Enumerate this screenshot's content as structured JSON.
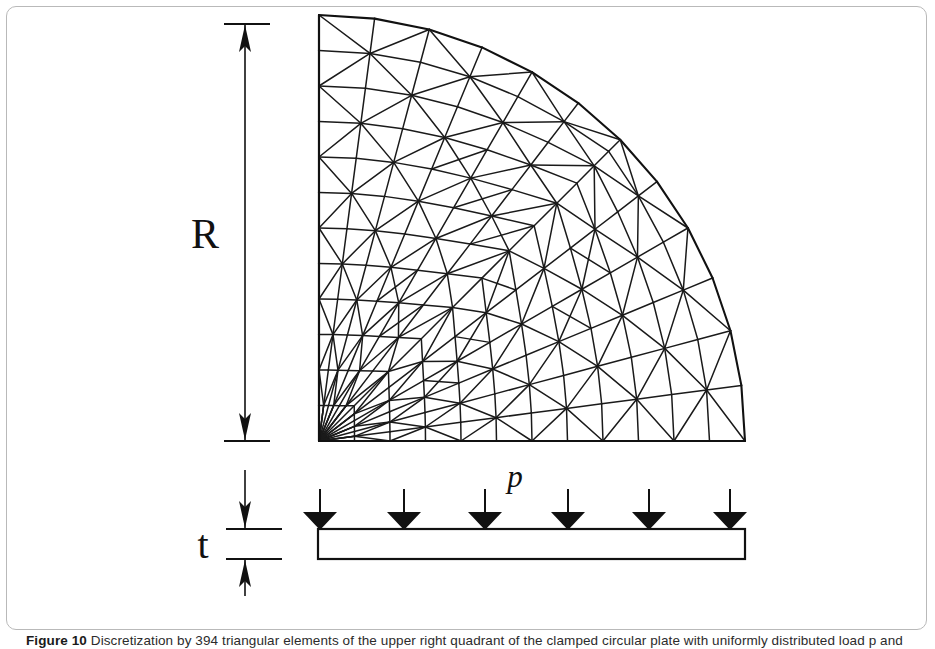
{
  "figure": {
    "caption_label": "Figure 10",
    "caption_text": "Discretization by 394 triangular elements of the upper right quadrant of the clamped circular plate with uniformly distributed load p and thickness t.",
    "background_color": "#ffffff",
    "line_color": "#111111",
    "frame_color": "#b9b9b9"
  },
  "labels": {
    "radius": "R",
    "thickness": "t",
    "pressure": "p"
  },
  "dimensions": {
    "radius_dimension_name": "R",
    "thickness_dimension_name": "t",
    "load_symbol": "p",
    "load_arrow_count": 6
  },
  "mesh": {
    "element_type": "triangular",
    "region": "quarter-disk",
    "left_edge_x": 319,
    "right_edge_x": 745,
    "top_edge_y": 24,
    "bottom_edge_y": 441
  },
  "plate": {
    "left_x": 318,
    "right_x": 745,
    "top_y": 529,
    "bottom_y": 559
  },
  "chart_data": {
    "type": "diagram",
    "annotations": [
      "R",
      "t",
      "p"
    ]
  }
}
